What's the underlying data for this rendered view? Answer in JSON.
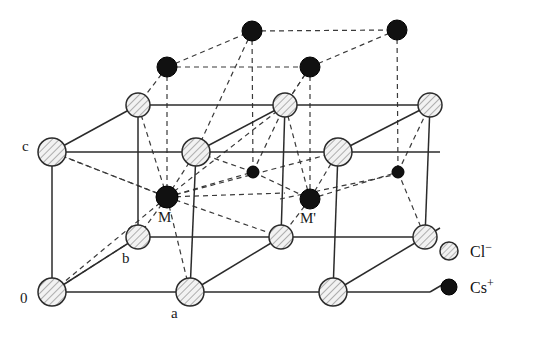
{
  "figure": {
    "type": "crystal-structure-diagram",
    "background": "#ffffff",
    "width": 542,
    "height": 338
  },
  "colors": {
    "line": "#2b2b2b",
    "dashed": "#3a3a3a",
    "chloride_fill": "#ececec",
    "chloride_stroke": "#2b2b2b",
    "chloride_hatch": "#8c8c8c",
    "caesium_fill": "#111111",
    "caesium_stroke": "#000000",
    "text": "#1a1a1a"
  },
  "legend": {
    "items": [
      {
        "symbol": "hatched-circle",
        "label": "Cl",
        "charge": "−",
        "name": "chloride-ion",
        "cx": 449,
        "cy": 251,
        "r": 9
      },
      {
        "symbol": "filled-circle",
        "label": "Cs",
        "charge": "+",
        "name": "caesium-ion",
        "cx": 449,
        "cy": 287,
        "r": 8
      }
    ],
    "text_x": 470
  },
  "axis_labels": [
    {
      "id": "origin",
      "text": "0",
      "x": 20,
      "y": 303
    },
    {
      "id": "a-axis",
      "text": "a",
      "x": 171,
      "y": 318
    },
    {
      "id": "b-axis",
      "text": "b",
      "x": 122,
      "y": 263
    },
    {
      "id": "c-axis",
      "text": "c",
      "x": 22,
      "y": 151
    },
    {
      "id": "m-site",
      "text": "M",
      "x": 158,
      "y": 222
    },
    {
      "id": "m-prime",
      "text": "M'",
      "x": 300,
      "y": 223
    }
  ],
  "chloride_ions": [
    {
      "id": "cl-front-bottom-left",
      "cx": 52,
      "cy": 292,
      "r": 14
    },
    {
      "id": "cl-front-bottom-mid",
      "cx": 190,
      "cy": 292,
      "r": 14
    },
    {
      "id": "cl-front-bottom-right",
      "cx": 333,
      "cy": 292,
      "r": 14
    },
    {
      "id": "cl-mid-row-left",
      "cx": 138,
      "cy": 237,
      "r": 12
    },
    {
      "id": "cl-mid-row-mid",
      "cx": 281,
      "cy": 237,
      "r": 12
    },
    {
      "id": "cl-mid-row-right",
      "cx": 425,
      "cy": 237,
      "r": 12
    },
    {
      "id": "cl-front-top-left",
      "cx": 52,
      "cy": 152,
      "r": 14
    },
    {
      "id": "cl-front-top-mid",
      "cx": 196,
      "cy": 152,
      "r": 14
    },
    {
      "id": "cl-front-top-right",
      "cx": 338,
      "cy": 152,
      "r": 14
    },
    {
      "id": "cl-back-top-left",
      "cx": 138,
      "cy": 105,
      "r": 12
    },
    {
      "id": "cl-back-top-mid",
      "cx": 285,
      "cy": 105,
      "r": 12
    },
    {
      "id": "cl-back-top-right",
      "cx": 430,
      "cy": 105,
      "r": 12
    }
  ],
  "caesium_ions": [
    {
      "id": "cs-M",
      "cx": 167,
      "cy": 197,
      "r": 11,
      "labelled": "M"
    },
    {
      "id": "cs-M-prime",
      "cx": 310,
      "cy": 199,
      "r": 10,
      "labelled": "M'"
    },
    {
      "id": "cs-upper-left",
      "cx": 167,
      "cy": 67,
      "r": 10,
      "labelled": ""
    },
    {
      "id": "cs-upper-mid",
      "cx": 310,
      "cy": 67,
      "r": 10,
      "labelled": ""
    },
    {
      "id": "cs-top-left",
      "cx": 252,
      "cy": 31,
      "r": 10,
      "labelled": ""
    },
    {
      "id": "cs-top-right",
      "cx": 397,
      "cy": 30,
      "r": 10,
      "labelled": ""
    },
    {
      "id": "cs-small-mid",
      "cx": 253,
      "cy": 172,
      "r": 6,
      "labelled": ""
    },
    {
      "id": "cs-small-right",
      "cx": 398,
      "cy": 172,
      "r": 6,
      "labelled": ""
    }
  ],
  "solid_edges": [
    {
      "id": "front-bottom-1",
      "x1": 52,
      "y1": 292,
      "x2": 190,
      "y2": 292
    },
    {
      "id": "front-bottom-2",
      "x1": 190,
      "y1": 292,
      "x2": 333,
      "y2": 292
    },
    {
      "id": "front-bottom-3",
      "x1": 333,
      "y1": 292,
      "x2": 430,
      "y2": 292
    },
    {
      "id": "front-top-1",
      "x1": 52,
      "y1": 152,
      "x2": 196,
      "y2": 152
    },
    {
      "id": "front-top-2",
      "x1": 196,
      "y1": 152,
      "x2": 338,
      "y2": 152
    },
    {
      "id": "front-top-3",
      "x1": 338,
      "y1": 152,
      "x2": 440,
      "y2": 152
    },
    {
      "id": "back-top-1",
      "x1": 138,
      "y1": 105,
      "x2": 285,
      "y2": 105
    },
    {
      "id": "back-top-2",
      "x1": 285,
      "y1": 105,
      "x2": 430,
      "y2": 105
    },
    {
      "id": "mid-row-1",
      "x1": 138,
      "y1": 237,
      "x2": 281,
      "y2": 237
    },
    {
      "id": "mid-row-2",
      "x1": 281,
      "y1": 237,
      "x2": 425,
      "y2": 237
    },
    {
      "id": "vert-left",
      "x1": 52,
      "y1": 152,
      "x2": 52,
      "y2": 292
    },
    {
      "id": "vert-mid-front",
      "x1": 196,
      "y1": 152,
      "x2": 190,
      "y2": 292
    },
    {
      "id": "vert-right-fr",
      "x1": 338,
      "y1": 152,
      "x2": 333,
      "y2": 292
    },
    {
      "id": "vert-back-left",
      "x1": 138,
      "y1": 105,
      "x2": 138,
      "y2": 237
    },
    {
      "id": "vert-back-mid",
      "x1": 285,
      "y1": 105,
      "x2": 281,
      "y2": 237
    },
    {
      "id": "vert-back-right",
      "x1": 430,
      "y1": 105,
      "x2": 425,
      "y2": 237
    },
    {
      "id": "diag-o-b",
      "x1": 52,
      "y1": 292,
      "x2": 138,
      "y2": 237
    },
    {
      "id": "diag-a-mid",
      "x1": 190,
      "y1": 292,
      "x2": 281,
      "y2": 237
    },
    {
      "id": "diag-r-mid",
      "x1": 333,
      "y1": 292,
      "x2": 425,
      "y2": 237
    },
    {
      "id": "diag-c-back",
      "x1": 52,
      "y1": 152,
      "x2": 138,
      "y2": 105
    },
    {
      "id": "diag-topmid-bk",
      "x1": 196,
      "y1": 152,
      "x2": 285,
      "y2": 105
    },
    {
      "id": "diag-toprt-bk",
      "x1": 338,
      "y1": 152,
      "x2": 430,
      "y2": 105
    },
    {
      "id": "stub-bot-l",
      "x1": 425,
      "y1": 237,
      "x2": 440,
      "y2": 228
    },
    {
      "id": "stub-bot-r",
      "x1": 430,
      "y1": 292,
      "x2": 447,
      "y2": 282
    }
  ],
  "dashed_edges": [
    {
      "id": "cs-top-row-1",
      "x1": 252,
      "y1": 31,
      "x2": 397,
      "y2": 30
    },
    {
      "id": "cs-mid-row-1",
      "x1": 167,
      "y1": 67,
      "x2": 310,
      "y2": 67
    },
    {
      "id": "cs-diag-1",
      "x1": 167,
      "y1": 67,
      "x2": 252,
      "y2": 31
    },
    {
      "id": "cs-diag-2",
      "x1": 310,
      "y1": 67,
      "x2": 397,
      "y2": 30
    },
    {
      "id": "cs-vert-1",
      "x1": 167,
      "y1": 67,
      "x2": 167,
      "y2": 197
    },
    {
      "id": "cs-vert-2",
      "x1": 310,
      "y1": 67,
      "x2": 310,
      "y2": 199
    },
    {
      "id": "cs-vert-3",
      "x1": 252,
      "y1": 31,
      "x2": 253,
      "y2": 172
    },
    {
      "id": "cs-vert-4",
      "x1": 397,
      "y1": 30,
      "x2": 398,
      "y2": 172
    },
    {
      "id": "cs-m-row",
      "x1": 167,
      "y1": 197,
      "x2": 253,
      "y2": 172
    },
    {
      "id": "cs-m-row-b",
      "x1": 253,
      "y1": 172,
      "x2": 310,
      "y2": 199
    },
    {
      "id": "cs-mp-row",
      "x1": 310,
      "y1": 199,
      "x2": 398,
      "y2": 172
    },
    {
      "id": "cs-m-horiz",
      "x1": 167,
      "y1": 197,
      "x2": 285,
      "y2": 193
    },
    {
      "id": "cs-mp-horiz",
      "x1": 280,
      "y1": 199,
      "x2": 398,
      "y2": 174
    },
    {
      "id": "m-to-c",
      "x1": 167,
      "y1": 197,
      "x2": 52,
      "y2": 152
    },
    {
      "id": "m-to-o",
      "x1": 167,
      "y1": 197,
      "x2": 52,
      "y2": 292
    },
    {
      "id": "m-to-ftl",
      "x1": 167,
      "y1": 197,
      "x2": 196,
      "y2": 152
    },
    {
      "id": "m-to-btl",
      "x1": 167,
      "y1": 197,
      "x2": 138,
      "y2": 105
    },
    {
      "id": "m-to-b",
      "x1": 167,
      "y1": 197,
      "x2": 138,
      "y2": 237
    },
    {
      "id": "m-to-a",
      "x1": 167,
      "y1": 197,
      "x2": 190,
      "y2": 292
    },
    {
      "id": "m-to-midrow",
      "x1": 167,
      "y1": 197,
      "x2": 281,
      "y2": 237
    },
    {
      "id": "m-to-ftr",
      "x1": 167,
      "y1": 197,
      "x2": 338,
      "y2": 152
    },
    {
      "id": "m-to-btm",
      "x1": 167,
      "y1": 197,
      "x2": 285,
      "y2": 105
    },
    {
      "id": "mp-to-ftm",
      "x1": 310,
      "y1": 199,
      "x2": 285,
      "y2": 105
    },
    {
      "id": "mp-to-cl",
      "x1": 310,
      "y1": 199,
      "x2": 338,
      "y2": 152
    },
    {
      "id": "mp-to-left",
      "x1": 310,
      "y1": 199,
      "x2": 281,
      "y2": 237
    },
    {
      "id": "csmid-to-btm",
      "x1": 253,
      "y1": 172,
      "x2": 285,
      "y2": 105
    },
    {
      "id": "csmid-to-ftm",
      "x1": 253,
      "y1": 172,
      "x2": 196,
      "y2": 152
    },
    {
      "id": "cstop-to-ftm",
      "x1": 252,
      "y1": 31,
      "x2": 196,
      "y2": 152
    },
    {
      "id": "csul-to-btl",
      "x1": 167,
      "y1": 67,
      "x2": 138,
      "y2": 105
    },
    {
      "id": "csum-to-btm",
      "x1": 310,
      "y1": 67,
      "x2": 285,
      "y2": 105
    },
    {
      "id": "csum-to-ftm",
      "x1": 310,
      "y1": 67,
      "x2": 285,
      "y2": 105
    },
    {
      "id": "o-to-b-ghost",
      "x1": 52,
      "y1": 292,
      "x2": 138,
      "y2": 237
    },
    {
      "id": "c-to-m-ghost",
      "x1": 52,
      "y1": 152,
      "x2": 167,
      "y2": 197
    },
    {
      "id": "csright-to-mid",
      "x1": 398,
      "y1": 172,
      "x2": 430,
      "y2": 105
    },
    {
      "id": "csright-stub",
      "x1": 398,
      "y1": 172,
      "x2": 425,
      "y2": 237
    }
  ]
}
